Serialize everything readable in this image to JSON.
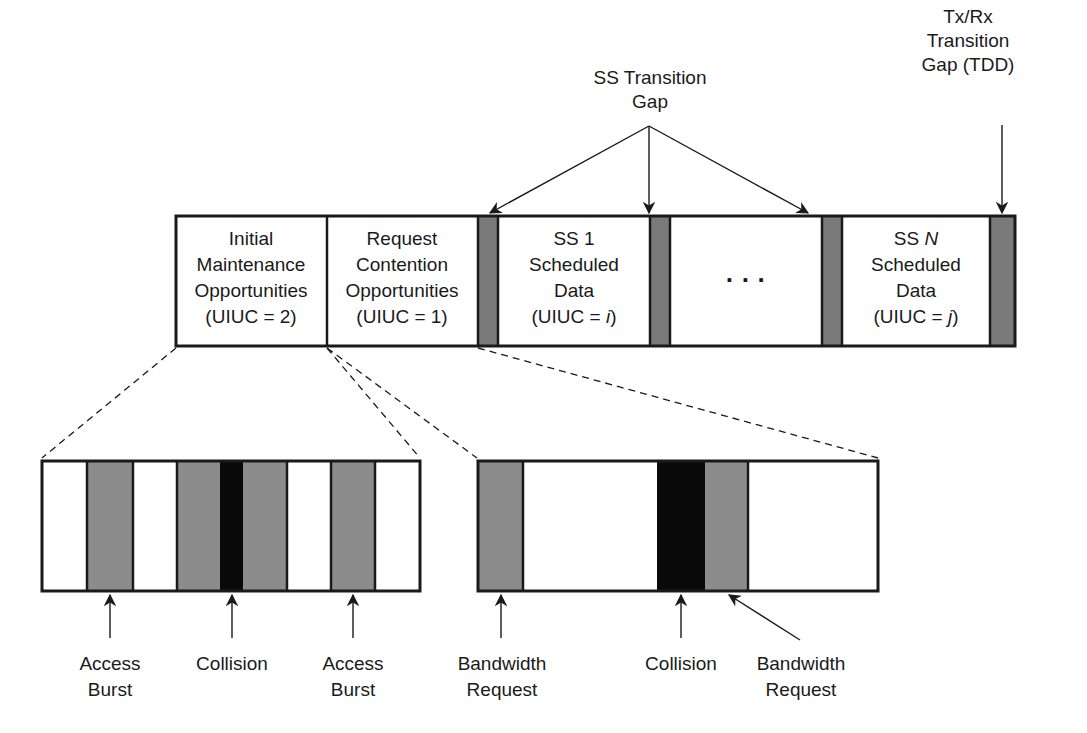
{
  "colors": {
    "stroke": "#1a1a1a",
    "gap_gray": "#7a7a7a",
    "burst_gray": "#8c8c8c",
    "collision": "#0a0a0a",
    "background": "#ffffff"
  },
  "top_labels": {
    "ss_transition_gap": [
      "SS Transition",
      "Gap"
    ],
    "txrx_transition_gap": [
      "Tx/Rx",
      "Transition",
      "Gap (TDD)"
    ]
  },
  "frame": {
    "segments": [
      {
        "id": "initial-maintenance",
        "lines": [
          "Initial",
          "Maintenance",
          "Opportunities",
          "(UIUC = 2)"
        ]
      },
      {
        "id": "request-contention",
        "lines": [
          "Request",
          "Contention",
          "Opportunities",
          "(UIUC = 1)"
        ]
      },
      {
        "id": "ss1-scheduled",
        "lines": [
          "SS 1",
          "Scheduled",
          "Data",
          "(UIUC = ",
          "i",
          ")"
        ]
      },
      {
        "id": "ellipsis",
        "lines": [
          "· · ·"
        ]
      },
      {
        "id": "ssn-scheduled",
        "lines": [
          "SS ",
          "N",
          "Scheduled",
          "Data",
          "(UIUC = ",
          "j",
          ")"
        ]
      }
    ]
  },
  "initial_maintenance_detail": {
    "slots": [
      "empty",
      "access-burst",
      "empty",
      "burst",
      "collision",
      "burst",
      "empty",
      "access-burst",
      "empty"
    ],
    "labels": {
      "access_burst_1": [
        "Access",
        "Burst"
      ],
      "collision": [
        "Collision"
      ],
      "access_burst_2": [
        "Access",
        "Burst"
      ]
    }
  },
  "request_contention_detail": {
    "slots": [
      "bandwidth-request",
      "empty",
      "collision",
      "bandwidth-request",
      "empty"
    ],
    "labels": {
      "bandwidth_request_1": [
        "Bandwidth",
        "Request"
      ],
      "collision": [
        "Collision"
      ],
      "bandwidth_request_2": [
        "Bandwidth",
        "Request"
      ]
    }
  }
}
